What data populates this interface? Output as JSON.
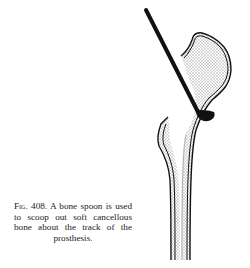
{
  "figure": {
    "number_label": "Fig. 408.",
    "caption_text": "A bone spoon is used to scoop out soft can­cellous bone about the track of the prosthesis.",
    "illustration": "bone-spoon-in-proximal-femur",
    "colors": {
      "ink": "#111111",
      "stipple": "#c8c8c8",
      "background": "#ffffff"
    }
  }
}
